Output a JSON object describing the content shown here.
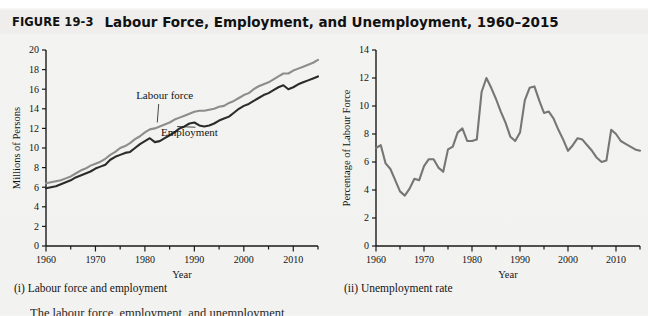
{
  "figure": {
    "number": "FIGURE 19-3",
    "title": "Labour Force, Employment, and Unemployment, 1960–2015",
    "subcaption_left": "(i) Labour force and employment",
    "subcaption_right": "(ii) Unemployment rate",
    "body_text_fragment": "The labour force, employment, and unemployment"
  },
  "colors": {
    "labour_force_line": "#8d8d8d",
    "employment_line": "#2b2b2b",
    "unemployment_line": "#767676",
    "axis": "#1a1a1a",
    "background": "#f2f2f0",
    "title_bar": "#efeeec"
  },
  "chart_data": [
    {
      "type": "line",
      "id": "labour-force-employment",
      "title": "(i) Labour force and employment",
      "xlabel": "Year",
      "ylabel": "Millions of Persons",
      "xlim": [
        1960,
        2015
      ],
      "ylim": [
        0,
        20
      ],
      "ytick_step": 2,
      "yticks": [
        0,
        2,
        4,
        6,
        8,
        10,
        12,
        14,
        16,
        18,
        20
      ],
      "xticks": [
        1960,
        1970,
        1980,
        1990,
        2000,
        2010
      ],
      "xminor_step": 5,
      "grid": false,
      "legend": "inline-annotations",
      "annotations": [
        {
          "label": "Labour force",
          "x": 1984,
          "y": 15.0
        },
        {
          "label": "Employment",
          "x": 1989,
          "y": 11.2
        }
      ],
      "x": [
        1960,
        1961,
        1962,
        1963,
        1964,
        1965,
        1966,
        1967,
        1968,
        1969,
        1970,
        1971,
        1972,
        1973,
        1974,
        1975,
        1976,
        1977,
        1978,
        1979,
        1980,
        1981,
        1982,
        1983,
        1984,
        1985,
        1986,
        1987,
        1988,
        1989,
        1990,
        1991,
        1992,
        1993,
        1994,
        1995,
        1996,
        1997,
        1998,
        1999,
        2000,
        2001,
        2002,
        2003,
        2004,
        2005,
        2006,
        2007,
        2008,
        2009,
        2010,
        2011,
        2012,
        2013,
        2014,
        2015
      ],
      "series": [
        {
          "name": "Labour force",
          "color": "#8d8d8d",
          "values": [
            6.4,
            6.5,
            6.6,
            6.7,
            6.9,
            7.1,
            7.4,
            7.7,
            7.9,
            8.2,
            8.4,
            8.6,
            8.9,
            9.3,
            9.6,
            10.0,
            10.2,
            10.5,
            10.9,
            11.2,
            11.6,
            11.9,
            12.0,
            12.2,
            12.4,
            12.6,
            12.9,
            13.1,
            13.3,
            13.5,
            13.7,
            13.8,
            13.8,
            13.9,
            14.0,
            14.2,
            14.3,
            14.6,
            14.8,
            15.1,
            15.4,
            15.6,
            16.0,
            16.3,
            16.5,
            16.7,
            17.0,
            17.3,
            17.6,
            17.6,
            17.9,
            18.1,
            18.3,
            18.5,
            18.7,
            19.0
          ]
        },
        {
          "name": "Employment",
          "color": "#2b2b2b",
          "values": [
            5.9,
            6.0,
            6.1,
            6.3,
            6.5,
            6.7,
            7.0,
            7.2,
            7.4,
            7.6,
            7.9,
            8.1,
            8.3,
            8.8,
            9.1,
            9.3,
            9.5,
            9.6,
            10.0,
            10.4,
            10.7,
            11.0,
            10.6,
            10.7,
            11.0,
            11.3,
            11.6,
            12.0,
            12.2,
            12.5,
            12.6,
            12.3,
            12.2,
            12.3,
            12.5,
            12.8,
            13.0,
            13.2,
            13.6,
            14.0,
            14.3,
            14.5,
            14.8,
            15.1,
            15.4,
            15.6,
            15.9,
            16.2,
            16.4,
            16.0,
            16.2,
            16.5,
            16.7,
            16.9,
            17.1,
            17.3
          ]
        }
      ]
    },
    {
      "type": "line",
      "id": "unemployment-rate",
      "title": "(ii) Unemployment rate",
      "xlabel": "Year",
      "ylabel": "Percentage of Labour Force",
      "xlim": [
        1960,
        2015
      ],
      "ylim": [
        0,
        14
      ],
      "ytick_step": 2,
      "yticks": [
        0,
        2,
        4,
        6,
        8,
        10,
        12,
        14
      ],
      "xticks": [
        1960,
        1970,
        1980,
        1990,
        2000,
        2010
      ],
      "xminor_step": 5,
      "grid": false,
      "x": [
        1960,
        1961,
        1962,
        1963,
        1964,
        1965,
        1966,
        1967,
        1968,
        1969,
        1970,
        1971,
        1972,
        1973,
        1974,
        1975,
        1976,
        1977,
        1978,
        1979,
        1980,
        1981,
        1982,
        1983,
        1984,
        1985,
        1986,
        1987,
        1988,
        1989,
        1990,
        1991,
        1992,
        1993,
        1994,
        1995,
        1996,
        1997,
        1998,
        1999,
        2000,
        2001,
        2002,
        2003,
        2004,
        2005,
        2006,
        2007,
        2008,
        2009,
        2010,
        2011,
        2012,
        2013,
        2014,
        2015
      ],
      "series": [
        {
          "name": "Unemployment rate",
          "color": "#767676",
          "values": [
            7.0,
            7.2,
            5.9,
            5.5,
            4.7,
            3.9,
            3.6,
            4.1,
            4.8,
            4.7,
            5.7,
            6.2,
            6.2,
            5.6,
            5.3,
            6.9,
            7.1,
            8.1,
            8.4,
            7.5,
            7.5,
            7.6,
            11.0,
            12.0,
            11.3,
            10.5,
            9.6,
            8.8,
            7.8,
            7.5,
            8.1,
            10.4,
            11.3,
            11.4,
            10.4,
            9.5,
            9.6,
            9.1,
            8.3,
            7.6,
            6.8,
            7.2,
            7.7,
            7.6,
            7.2,
            6.8,
            6.3,
            6.0,
            6.1,
            8.3,
            8.0,
            7.5,
            7.3,
            7.1,
            6.9,
            6.8
          ]
        }
      ]
    }
  ]
}
